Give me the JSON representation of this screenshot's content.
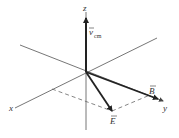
{
  "diagram": {
    "axes": {
      "x": "x",
      "y": "y",
      "z": "z"
    },
    "vectors": {
      "v_cm": {
        "symbol": "v",
        "subscript": "cm"
      },
      "B": {
        "symbol": "B"
      },
      "E": {
        "symbol": "E"
      }
    },
    "colors": {
      "line": "#555555",
      "vector": "#222222",
      "text": "#333333"
    }
  }
}
